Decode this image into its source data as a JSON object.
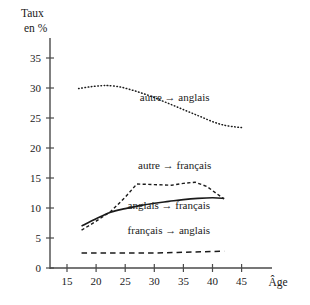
{
  "chart_data": {
    "type": "line",
    "title": "",
    "xlabel": "Âge",
    "ylabel": "Taux en %",
    "ylabel_line1": "Taux",
    "ylabel_line2": "en %",
    "xlim": [
      13,
      48
    ],
    "ylim": [
      0,
      37
    ],
    "grid": false,
    "legend_position": "inline-annotations",
    "xticks": [
      "15",
      "20",
      "25",
      "30",
      "35",
      "40",
      "45"
    ],
    "xtick_values": [
      15,
      20,
      25,
      30,
      35,
      40,
      45
    ],
    "yticks": [
      "0",
      "5",
      "10",
      "15",
      "20",
      "25",
      "30",
      "35"
    ],
    "ytick_values": [
      0,
      5,
      10,
      15,
      20,
      25,
      30,
      35
    ],
    "series": [
      {
        "name": "autre → anglais",
        "style": "dotted",
        "x": [
          17,
          19,
          21,
          22,
          24,
          26,
          28,
          30,
          32,
          34,
          36,
          38,
          40,
          42,
          44,
          45
        ],
        "values": [
          29.9,
          30.2,
          30.4,
          30.4,
          30.2,
          29.7,
          29.1,
          28.4,
          27.6,
          26.8,
          26.0,
          25.2,
          24.4,
          23.8,
          23.5,
          23.4
        ]
      },
      {
        "name": "autre → français",
        "style": "dashed",
        "x": [
          17.5,
          20,
          22.5,
          25,
          27,
          30,
          33,
          35,
          37,
          39,
          42
        ],
        "values": [
          6.3,
          7.8,
          9.4,
          11.8,
          14.0,
          13.9,
          13.8,
          14.1,
          14.3,
          13.6,
          11.5
        ]
      },
      {
        "name": "anglais → français",
        "style": "solid",
        "x": [
          17.5,
          20,
          22.5,
          25,
          27.5,
          30,
          32.5,
          35,
          37.5,
          40,
          42
        ],
        "values": [
          7.0,
          8.2,
          9.3,
          9.9,
          10.4,
          10.8,
          11.1,
          11.4,
          11.6,
          11.7,
          11.6
        ]
      },
      {
        "name": "français → anglais",
        "style": "longdash",
        "x": [
          17.5,
          22,
          26,
          30,
          34,
          38,
          42
        ],
        "values": [
          2.5,
          2.5,
          2.5,
          2.5,
          2.6,
          2.7,
          2.8
        ]
      }
    ],
    "annotations": [
      {
        "text": "autre → anglais",
        "x": 33.5,
        "y": 27.8
      },
      {
        "text": "autre → français",
        "x": 33.5,
        "y": 16.5
      },
      {
        "text": "anglais → français",
        "x": 32.5,
        "y": 9.8
      },
      {
        "text": "français → anglais",
        "x": 32.5,
        "y": 5.6
      }
    ],
    "colors": {
      "ink": "#1a1a1a",
      "axis": "#4a4a4a",
      "background": "#ffffff"
    }
  }
}
